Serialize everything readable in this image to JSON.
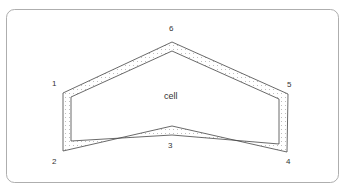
{
  "diagram": {
    "center_label": "cell",
    "vertex_labels": [
      {
        "id": "1",
        "text": "1",
        "x": 52,
        "y": 80
      },
      {
        "id": "2",
        "text": "2",
        "x": 52,
        "y": 158
      },
      {
        "id": "3",
        "text": "3",
        "x": 168,
        "y": 142
      },
      {
        "id": "4",
        "text": "4",
        "x": 286,
        "y": 158
      },
      {
        "id": "5",
        "text": "5",
        "x": 287,
        "y": 81
      },
      {
        "id": "6",
        "text": "6",
        "x": 169,
        "y": 25
      }
    ],
    "outer_polygon": [
      [
        63,
        93
      ],
      [
        172,
        42
      ],
      [
        288,
        94
      ],
      [
        287,
        152
      ],
      [
        172,
        126
      ],
      [
        63,
        151
      ]
    ],
    "inner_polygon": [
      [
        71,
        97
      ],
      [
        172,
        51
      ],
      [
        279,
        99
      ],
      [
        279,
        144
      ],
      [
        172,
        135
      ],
      [
        71,
        141
      ]
    ],
    "colors": {
      "stroke": "#444444",
      "frame": "#888888",
      "dots": "#999999"
    }
  }
}
